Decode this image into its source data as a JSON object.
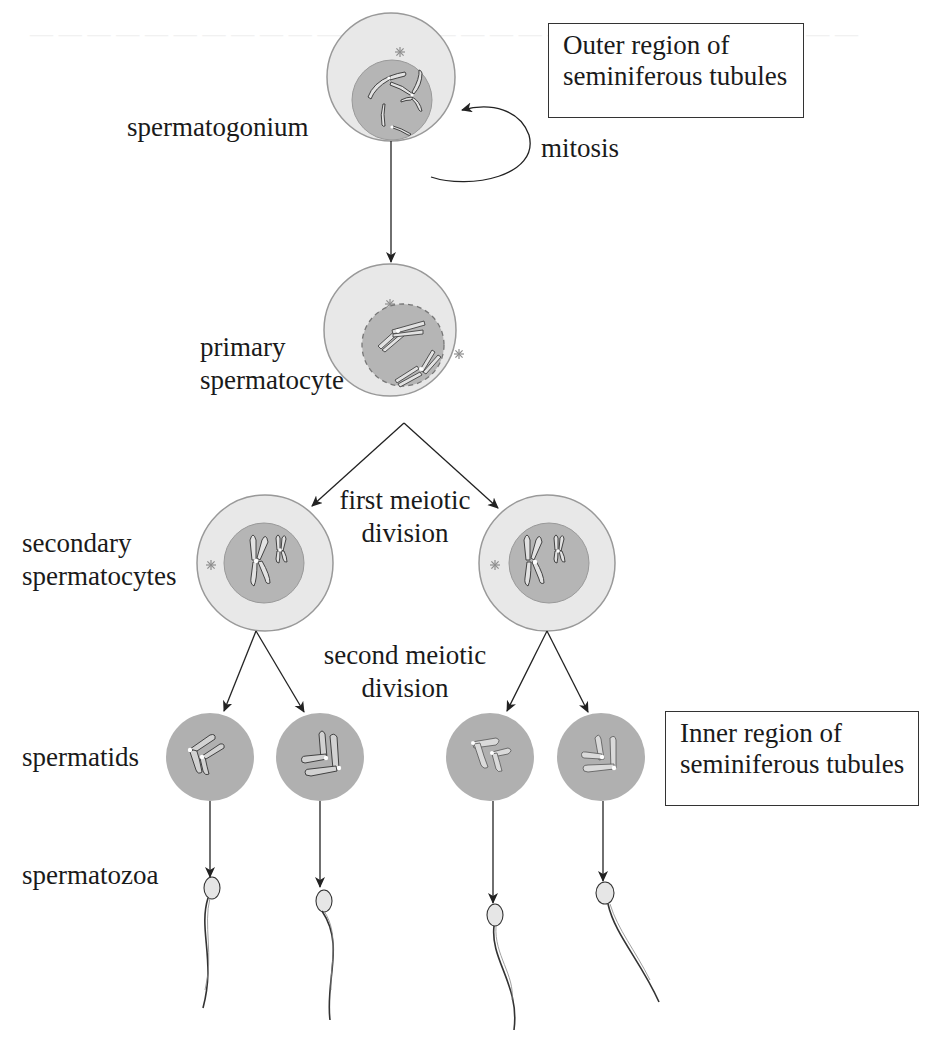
{
  "diagram": {
    "type": "flowchart",
    "region_boxes": {
      "outer": {
        "line1": "Outer region of",
        "line2": "seminiferous tubules"
      },
      "inner": {
        "line1": "Inner region of",
        "line2": "seminiferous tubules"
      }
    },
    "stages": {
      "spermatogonium": "spermatogonium",
      "primary_line1": "primary",
      "primary_line2": "spermatocyte",
      "secondary_line1": "secondary",
      "secondary_line2": "spermatocytes",
      "spermatids": "spermatids",
      "spermatozoa": "spermatozoa"
    },
    "processes": {
      "mitosis": "mitosis",
      "first_meiotic_line1": "first meiotic",
      "first_meiotic_line2": "division",
      "second_meiotic_line1": "second meiotic",
      "second_meiotic_line2": "division"
    },
    "colors": {
      "cytoplasm": "#e6e6e6",
      "cell_outline": "#9a9a9a",
      "nucleus": "#b4b4b4",
      "spermatid": "#b0b0b0",
      "chromosome": "#dcdcdc",
      "arrow": "#222222",
      "text": "#1a1a1a"
    },
    "edges": [
      {
        "from": "spermatogonium",
        "to": "spermatogonium",
        "label": "mitosis"
      },
      {
        "from": "spermatogonium",
        "to": "primary spermatocyte"
      },
      {
        "from": "primary spermatocyte",
        "to": "secondary spermatocyte (left)",
        "label": "first meiotic division"
      },
      {
        "from": "primary spermatocyte",
        "to": "secondary spermatocyte (right)",
        "label": "first meiotic division"
      },
      {
        "from": "secondary spermatocyte (left)",
        "to": "spermatid 1",
        "label": "second meiotic division"
      },
      {
        "from": "secondary spermatocyte (left)",
        "to": "spermatid 2",
        "label": "second meiotic division"
      },
      {
        "from": "secondary spermatocyte (right)",
        "to": "spermatid 3",
        "label": "second meiotic division"
      },
      {
        "from": "secondary spermatocyte (right)",
        "to": "spermatid 4",
        "label": "second meiotic division"
      },
      {
        "from": "spermatid 1",
        "to": "spermatozoon 1"
      },
      {
        "from": "spermatid 2",
        "to": "spermatozoon 2"
      },
      {
        "from": "spermatid 3",
        "to": "spermatozoon 3"
      },
      {
        "from": "spermatid 4",
        "to": "spermatozoon 4"
      }
    ]
  }
}
